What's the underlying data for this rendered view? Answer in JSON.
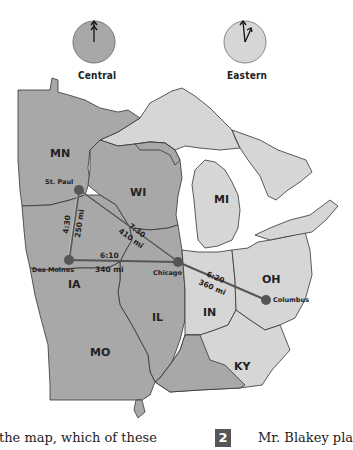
{
  "clocks": [
    {
      "id": "central",
      "label": "Central",
      "fill": "#a8a8a8",
      "hour_angle": 0,
      "minute_angle": 0
    },
    {
      "id": "eastern",
      "label": "Eastern",
      "fill": "#d6d6d6",
      "hour_angle": 30,
      "minute_angle": 0
    }
  ],
  "legend_colors": {
    "central_zone": "#a8a8a8",
    "eastern_zone": "#d6d6d6",
    "route_line": "#555555",
    "city_dot": "#555555"
  },
  "states": [
    {
      "abbr": "MN",
      "zone": "central"
    },
    {
      "abbr": "WI",
      "zone": "central"
    },
    {
      "abbr": "MI",
      "zone": "eastern"
    },
    {
      "abbr": "IA",
      "zone": "central"
    },
    {
      "abbr": "IL",
      "zone": "central"
    },
    {
      "abbr": "IN",
      "zone": "eastern"
    },
    {
      "abbr": "OH",
      "zone": "eastern"
    },
    {
      "abbr": "MO",
      "zone": "central"
    },
    {
      "abbr": "KY",
      "zone": "eastern"
    }
  ],
  "cities": [
    {
      "name": "St. Paul"
    },
    {
      "name": "Des Moines"
    },
    {
      "name": "Chicago"
    },
    {
      "name": "Columbus"
    }
  ],
  "routes": [
    {
      "from": "St. Paul",
      "to": "Des Moines",
      "time": "4:30",
      "distance": "250 mi"
    },
    {
      "from": "St. Paul",
      "to": "Chicago",
      "time": "7:30",
      "distance": "410 mi"
    },
    {
      "from": "Des Moines",
      "to": "Chicago",
      "time": "6:10",
      "distance": "340 mi"
    },
    {
      "from": "Chicago",
      "to": "Columbus",
      "time": "6:20",
      "distance": "360 mi"
    }
  ],
  "question_text": {
    "left_fragment": "the map, which of these",
    "number": "2",
    "right_fragment": "Mr. Blakey pla"
  }
}
